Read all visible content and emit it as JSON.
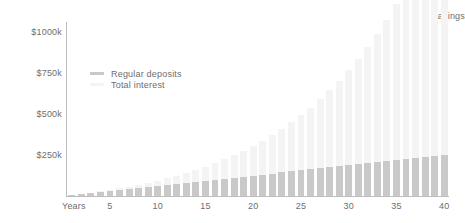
{
  "chart_data": {
    "type": "bar",
    "subtype": "stacked",
    "title": "",
    "xlabel": "Years",
    "ylabel": "Savings",
    "ylim": [
      0,
      1062
    ],
    "xlim": [
      1,
      40
    ],
    "grid": false,
    "legend_position": "inside-top-left",
    "y_tick_labels": [
      "$1000k",
      "$750k",
      "$500k",
      "$250k"
    ],
    "y_tick_values": [
      1000,
      750,
      500,
      250
    ],
    "x_tick_labels": [
      "5",
      "10",
      "15",
      "20",
      "25",
      "30",
      "35",
      "40"
    ],
    "x_tick_values": [
      5,
      10,
      15,
      20,
      25,
      30,
      35,
      40
    ],
    "x": [
      1,
      2,
      3,
      4,
      5,
      6,
      7,
      8,
      9,
      10,
      11,
      12,
      13,
      14,
      15,
      16,
      17,
      18,
      19,
      20,
      21,
      22,
      23,
      24,
      25,
      26,
      27,
      28,
      29,
      30,
      31,
      32,
      33,
      34,
      35,
      36,
      37,
      38,
      39,
      40
    ],
    "series": [
      {
        "name": "Regular deposits",
        "color": "#c9c9c9",
        "values": [
          6,
          12,
          19,
          25,
          31,
          37,
          44,
          50,
          56,
          62,
          69,
          75,
          81,
          87,
          94,
          100,
          106,
          112,
          119,
          125,
          131,
          137,
          144,
          150,
          156,
          162,
          169,
          175,
          181,
          187,
          194,
          200,
          206,
          212,
          219,
          225,
          231,
          237,
          244,
          250
        ]
      },
      {
        "name": "Total interest",
        "color": "#f4f4f4",
        "values": [
          0,
          1,
          2,
          4,
          7,
          10,
          14,
          19,
          25,
          32,
          40,
          49,
          60,
          72,
          85,
          100,
          117,
          136,
          157,
          180,
          206,
          234,
          265,
          299,
          336,
          377,
          421,
          470,
          523,
          580,
          643,
          711,
          785,
          865,
          952,
          1046,
          1148,
          1258,
          1377,
          1506
        ]
      }
    ],
    "stack_totals": [
      6,
      13,
      21,
      29,
      38,
      47,
      58,
      69,
      81,
      94,
      109,
      124,
      141,
      159,
      179,
      200,
      223,
      248,
      276,
      305,
      337,
      371,
      409,
      449,
      492,
      539,
      590,
      645,
      704,
      767,
      837,
      911,
      991,
      1077,
      1171,
      1271,
      1379,
      1495,
      1621,
      1756
    ]
  },
  "axes": {
    "y_title": "Savings",
    "x_title": "Years"
  },
  "legend": {
    "items": [
      {
        "label": "Regular deposits",
        "swatch_color": "#c9c9c9"
      },
      {
        "label": "Total interest",
        "swatch_color": "#f4f4f4"
      }
    ]
  },
  "colors": {
    "axis": "#bdbdbd",
    "text": "#6e6e6e",
    "background": "#ffffff",
    "deposits": "#c9c9c9",
    "interest": "#f4f4f4"
  }
}
